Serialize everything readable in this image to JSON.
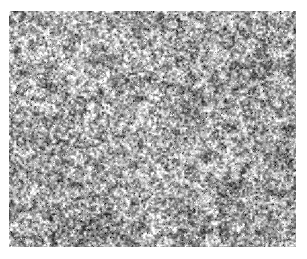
{
  "page": {
    "background_color": "#ffffff",
    "width": 307,
    "height": 259,
    "title": "",
    "caption": ""
  },
  "figure": {
    "name": "grayscale-micrograph",
    "kind": "micrograph",
    "has_border": false,
    "has_axes": false,
    "has_scale_bar": false,
    "has_labels": false,
    "region": {
      "x": 9,
      "y": 11,
      "width": 287,
      "height": 236
    },
    "colors": {
      "background": "#ffffff",
      "lightest": "#ffffff",
      "light": "#e2e2e2",
      "mid": "#a8a8a8",
      "dark": "#5c5c5c",
      "darkest": "#1a1a1a"
    },
    "texture": {
      "mean_gray": 168,
      "contrast": 0.82,
      "grain_size_px": 2.6,
      "cluster_size_px": 9,
      "seed": 20240517,
      "vignette_strength": 0.06,
      "brightness_bands": [
        {
          "cx": 0.18,
          "cy": 0.16,
          "radius": 0.42,
          "delta": 26
        },
        {
          "cx": 0.52,
          "cy": 0.72,
          "radius": 0.38,
          "delta": 18
        },
        {
          "cx": 0.82,
          "cy": 0.3,
          "radius": 0.34,
          "delta": -14
        },
        {
          "cx": 0.3,
          "cy": 0.86,
          "radius": 0.3,
          "delta": -10
        },
        {
          "cx": 0.72,
          "cy": 0.92,
          "radius": 0.26,
          "delta": -16
        }
      ]
    }
  }
}
